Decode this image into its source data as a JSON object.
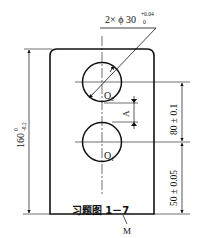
{
  "figure": {
    "caption": "习题图 1－7",
    "hole_spec_prefix": "2× ϕ 30",
    "hole_spec_upper_tol": "+0.04",
    "hole_spec_lower_tol": "0",
    "height_dim": "160",
    "height_upper_tol": "0",
    "height_lower_tol": "-0.2",
    "center_spacing_dim": "80 ± 0.1",
    "bottom_offset_dim": "50 ± 0.05",
    "dim_A": "A",
    "upper_center_label": "O",
    "upper_center_sub": "2",
    "lower_center_label": "O",
    "lower_center_sub": "1",
    "base_surface_label": "M"
  },
  "colors": {
    "line": "#111111",
    "background": "#ffffff"
  }
}
